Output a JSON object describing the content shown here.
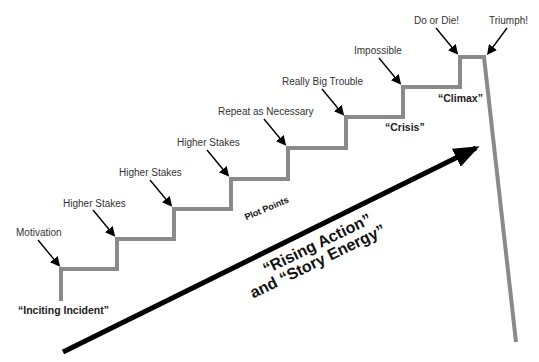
{
  "diagram": {
    "type": "staircase plot structure",
    "step_labels": [
      {
        "text": "Motivation"
      },
      {
        "text": "Higher Stakes"
      },
      {
        "text": "Higher Stakes"
      },
      {
        "text": "Higher Stakes"
      },
      {
        "text": "Repeat as Necessary"
      },
      {
        "text": "Really Big Trouble"
      },
      {
        "text": "Impossible"
      },
      {
        "text": "Do or Die!"
      },
      {
        "text": "Triumph!"
      }
    ],
    "phase_labels": {
      "inciting": "“Inciting Incident”",
      "crisis": "“Crisis”",
      "climax": "“Climax”",
      "plot_points": "Plot Points"
    },
    "arrow_label": {
      "line1": "“Rising Action”",
      "line2": "and “Story Energy”"
    },
    "colors": {
      "stairs": "#8a8a8a",
      "arrow": "#000000",
      "text": "#333333"
    }
  }
}
